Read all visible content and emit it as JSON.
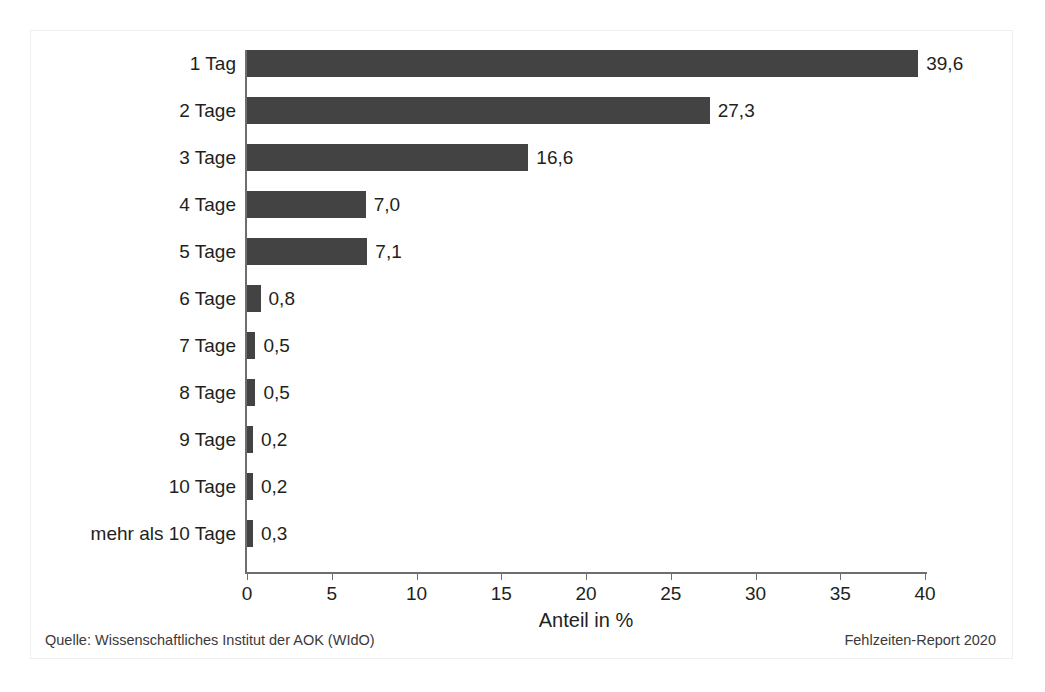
{
  "chart_data": {
    "type": "bar",
    "orientation": "horizontal",
    "title": "",
    "subtitle": "",
    "xlabel": "Anteil in %",
    "ylabel": "",
    "xlim": [
      0,
      40
    ],
    "xticks": [
      "0",
      "5",
      "10",
      "15",
      "20",
      "25",
      "30",
      "35",
      "40"
    ],
    "xtick_values": [
      0,
      5,
      10,
      15,
      20,
      25,
      30,
      35,
      40
    ],
    "grid": false,
    "legend": null,
    "categories": [
      "1 Tag",
      "2 Tage",
      "3 Tage",
      "4 Tage",
      "5 Tage",
      "6 Tage",
      "7 Tage",
      "8 Tage",
      "9 Tage",
      "10 Tage",
      "mehr als 10 Tage"
    ],
    "values": [
      39.6,
      27.3,
      16.6,
      7.0,
      7.1,
      0.8,
      0.5,
      0.5,
      0.2,
      0.2,
      0.3
    ],
    "value_labels": [
      "39,6",
      "27,3",
      "16,6",
      "7,0",
      "7,1",
      "0,8",
      "0,5",
      "0,5",
      "0,2",
      "0,2",
      "0,3"
    ],
    "bar_color": "#434343",
    "axis_color": "#6e6e6e",
    "background_color": "#ffffff"
  },
  "footer": {
    "source": "Quelle: Wissenschaftliches Institut der AOK (WIdO)",
    "report": "Fehlzeiten-Report 2020"
  }
}
